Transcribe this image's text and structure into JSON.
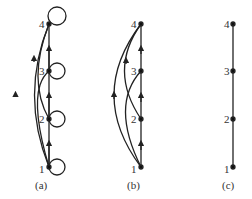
{
  "figure": {
    "panels": [
      {
        "caption": "(a)",
        "nodes": [
          "1",
          "2",
          "3",
          "4"
        ],
        "edges": [
          [
            "1",
            "2"
          ],
          [
            "2",
            "3"
          ],
          [
            "3",
            "4"
          ],
          [
            "1",
            "3"
          ],
          [
            "2",
            "4"
          ],
          [
            "1",
            "4"
          ],
          [
            "1",
            "1"
          ],
          [
            "2",
            "2"
          ],
          [
            "3",
            "3"
          ],
          [
            "4",
            "4"
          ]
        ]
      },
      {
        "caption": "(b)",
        "nodes": [
          "1",
          "2",
          "3",
          "4"
        ],
        "edges": [
          [
            "1",
            "2"
          ],
          [
            "2",
            "3"
          ],
          [
            "3",
            "4"
          ],
          [
            "1",
            "3"
          ],
          [
            "2",
            "4"
          ],
          [
            "1",
            "4"
          ]
        ]
      },
      {
        "caption": "(c)",
        "nodes": [
          "1",
          "2",
          "3",
          "4"
        ],
        "edges": [
          [
            "1",
            "2"
          ],
          [
            "2",
            "3"
          ],
          [
            "3",
            "4"
          ]
        ]
      }
    ]
  }
}
